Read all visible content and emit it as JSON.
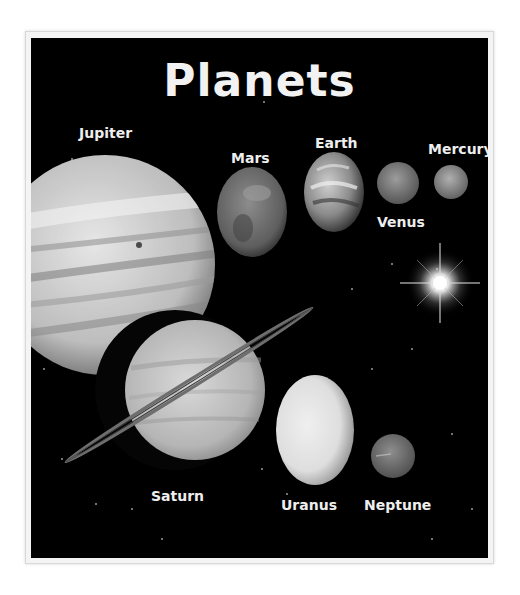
{
  "poster": {
    "title": "Planets",
    "background_color": "#000000",
    "text_color": "#eeeeee",
    "planets": [
      {
        "name": "Jupiter",
        "label": "Jupiter"
      },
      {
        "name": "Mars",
        "label": "Mars"
      },
      {
        "name": "Earth",
        "label": "Earth"
      },
      {
        "name": "Venus",
        "label": "Venus"
      },
      {
        "name": "Mercury",
        "label": "Mercury"
      },
      {
        "name": "Saturn",
        "label": "Saturn"
      },
      {
        "name": "Uranus",
        "label": "Uranus"
      },
      {
        "name": "Neptune",
        "label": "Neptune"
      }
    ],
    "sun": {
      "name": "Sun",
      "icon": "sun-star-icon"
    }
  }
}
